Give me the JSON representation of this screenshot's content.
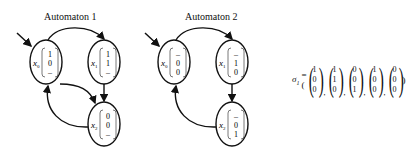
{
  "automata": [
    {
      "title": "Automaton 1",
      "states": [
        {
          "name": "x",
          "sub": "0",
          "vector": [
            "1",
            "0",
            "–"
          ]
        },
        {
          "name": "x",
          "sub": "1",
          "vector": [
            "1",
            "1",
            "–"
          ]
        },
        {
          "name": "x",
          "sub": "2",
          "vector": [
            "0",
            "0",
            "–"
          ]
        }
      ],
      "transitions": [
        [
          "x0",
          "x1"
        ],
        [
          "x0",
          "x2"
        ],
        [
          "x1",
          "x2"
        ],
        [
          "x2",
          "x0"
        ]
      ],
      "initial": "x0"
    },
    {
      "title": "Automaton 2",
      "states": [
        {
          "name": "x",
          "sub": "0",
          "vector": [
            "–",
            "0",
            "0"
          ]
        },
        {
          "name": "x",
          "sub": "1",
          "vector": [
            "–",
            "1",
            "0"
          ]
        },
        {
          "name": "x",
          "sub": "2",
          "vector": [
            "–",
            "0",
            "1"
          ]
        }
      ],
      "transitions": [
        [
          "x0",
          "x1"
        ],
        [
          "x1",
          "x2"
        ],
        [
          "x2",
          "x0"
        ]
      ],
      "initial": "x0"
    }
  ],
  "sequence": {
    "symbol": "σ",
    "sub": "1",
    "eq": "=(",
    "close": ")",
    "vectors": [
      [
        "1",
        "0",
        "0"
      ],
      [
        "1",
        "1",
        "0"
      ],
      [
        "0",
        "0",
        "1"
      ],
      [
        "1",
        "0",
        "0"
      ],
      [
        "0",
        "0",
        "0"
      ]
    ]
  }
}
